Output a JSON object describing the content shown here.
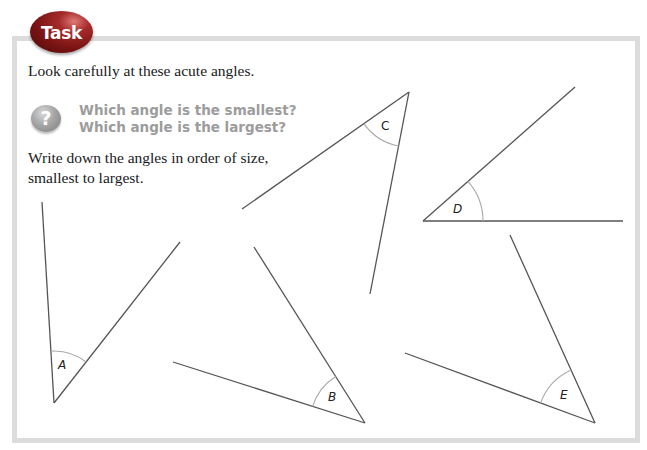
{
  "badge": {
    "label": "Task",
    "color": "#8b1a1a"
  },
  "intro_text": "Look carefully at these acute angles.",
  "question_icon": {
    "glyph": "?",
    "name": "question-icon"
  },
  "questions": [
    "Which angle is the smallest?",
    "Which angle is the largest?"
  ],
  "instruction_lines": [
    "Write down the angles in order of size,",
    "smallest to largest."
  ],
  "angles": [
    {
      "label": "A"
    },
    {
      "label": "B"
    },
    {
      "label": "C"
    },
    {
      "label": "D"
    },
    {
      "label": "E"
    }
  ],
  "colors": {
    "frame_border": "#dcdcdc",
    "line": "#555555",
    "arc": "#a8a8a8",
    "question_text": "#9c9c9c"
  }
}
